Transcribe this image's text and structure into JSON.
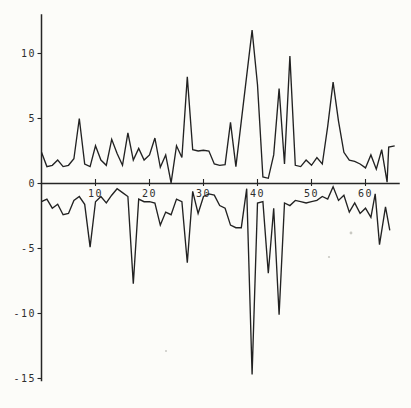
{
  "title": "",
  "colors": {
    "background": "#fcfcf9",
    "line": "#222222",
    "axis": "#262626",
    "label": "#2e2e2e",
    "speck": "#c9c9c3"
  },
  "chart_data": {
    "type": "line",
    "title": "",
    "xlabel": "",
    "ylabel": "",
    "xlim": [
      0,
      66
    ],
    "ylim": [
      -15.5,
      13
    ],
    "grid": false,
    "legend": false,
    "x_ticks": [
      10,
      20,
      30,
      40,
      50,
      60
    ],
    "x_tick_labels": [
      "10",
      "20",
      "30",
      "40",
      "50",
      "60"
    ],
    "y_ticks": [
      10,
      5,
      0,
      -5,
      -10,
      -15
    ],
    "y_tick_labels": [
      "10",
      "5",
      "0",
      "-5",
      "-10",
      "-15"
    ],
    "series": [
      {
        "name": "upper-line",
        "points": [
          [
            0,
            2.4
          ],
          [
            1,
            1.3
          ],
          [
            2,
            1.4
          ],
          [
            3,
            1.8
          ],
          [
            4,
            1.3
          ],
          [
            5,
            1.4
          ],
          [
            6,
            1.9
          ],
          [
            7,
            5.0
          ],
          [
            8,
            1.5
          ],
          [
            9,
            1.3
          ],
          [
            10,
            2.9
          ],
          [
            11,
            1.8
          ],
          [
            12,
            1.4
          ],
          [
            13,
            3.4
          ],
          [
            14,
            2.3
          ],
          [
            15,
            1.4
          ],
          [
            16,
            3.9
          ],
          [
            17,
            1.8
          ],
          [
            18,
            2.7
          ],
          [
            19,
            1.8
          ],
          [
            20,
            2.2
          ],
          [
            21,
            3.5
          ],
          [
            22,
            1.25
          ],
          [
            23,
            2.2
          ],
          [
            24,
            0.05
          ],
          [
            25,
            2.9
          ],
          [
            26,
            2.0
          ],
          [
            27,
            8.2
          ],
          [
            28,
            2.6
          ],
          [
            29,
            2.5
          ],
          [
            30,
            2.55
          ],
          [
            31,
            2.5
          ],
          [
            32,
            1.5
          ],
          [
            33,
            1.4
          ],
          [
            34,
            1.45
          ],
          [
            35,
            4.7
          ],
          [
            36,
            1.3
          ],
          [
            37,
            4.8
          ],
          [
            38,
            8.3
          ],
          [
            39,
            11.8
          ],
          [
            40,
            7.6
          ],
          [
            41,
            0.5
          ],
          [
            42,
            0.4
          ],
          [
            43,
            2.2
          ],
          [
            44,
            7.3
          ],
          [
            45,
            1.5
          ],
          [
            46,
            9.8
          ],
          [
            47,
            1.4
          ],
          [
            48,
            1.3
          ],
          [
            49,
            1.8
          ],
          [
            50,
            1.4
          ],
          [
            51,
            2.0
          ],
          [
            52,
            1.5
          ],
          [
            53,
            4.4
          ],
          [
            54,
            7.8
          ],
          [
            55,
            4.8
          ],
          [
            56,
            2.4
          ],
          [
            57,
            1.8
          ],
          [
            58,
            1.7
          ],
          [
            59,
            1.5
          ],
          [
            60,
            1.2
          ],
          [
            61,
            2.2
          ],
          [
            62,
            1.1
          ],
          [
            63,
            2.6
          ],
          [
            64,
            0.1
          ],
          [
            64.3,
            2.8
          ],
          [
            65.4,
            2.9
          ]
        ]
      },
      {
        "name": "lower-line",
        "points": [
          [
            0,
            -1.4
          ],
          [
            1,
            -1.2
          ],
          [
            2,
            -1.9
          ],
          [
            3,
            -1.6
          ],
          [
            4,
            -2.4
          ],
          [
            5,
            -2.3
          ],
          [
            6,
            -1.3
          ],
          [
            7,
            -1.0
          ],
          [
            8,
            -1.6
          ],
          [
            9,
            -4.9
          ],
          [
            10,
            -1.4
          ],
          [
            11,
            -1.0
          ],
          [
            12,
            -1.5
          ],
          [
            13,
            -0.9
          ],
          [
            14,
            -0.4
          ],
          [
            15,
            -0.7
          ],
          [
            16,
            -1.0
          ],
          [
            17,
            -7.7
          ],
          [
            18,
            -1.2
          ],
          [
            19,
            -1.4
          ],
          [
            20,
            -1.4
          ],
          [
            21,
            -1.5
          ],
          [
            22,
            -3.2
          ],
          [
            23,
            -2.2
          ],
          [
            24,
            -2.4
          ],
          [
            25,
            -1.2
          ],
          [
            26,
            -1.4
          ],
          [
            27,
            -6.1
          ],
          [
            28,
            -0.6
          ],
          [
            29,
            -2.3
          ],
          [
            30,
            -1.0
          ],
          [
            31,
            -0.8
          ],
          [
            32,
            -0.9
          ],
          [
            33,
            -1.7
          ],
          [
            34,
            -1.9
          ],
          [
            35,
            -3.2
          ],
          [
            36,
            -3.4
          ],
          [
            37,
            -3.4
          ],
          [
            38,
            -0.4
          ],
          [
            39,
            -14.7
          ],
          [
            40,
            -1.5
          ],
          [
            41,
            -1.4
          ],
          [
            42,
            -6.9
          ],
          [
            43,
            -1.9
          ],
          [
            44,
            -10.1
          ],
          [
            45,
            -1.5
          ],
          [
            46,
            -1.7
          ],
          [
            47,
            -1.3
          ],
          [
            48,
            -1.4
          ],
          [
            49,
            -1.5
          ],
          [
            50,
            -1.4
          ],
          [
            51,
            -1.3
          ],
          [
            52,
            -1.0
          ],
          [
            53,
            -1.2
          ],
          [
            54,
            -0.25
          ],
          [
            55,
            -1.3
          ],
          [
            56,
            -0.9
          ],
          [
            57,
            -2.2
          ],
          [
            58,
            -1.5
          ],
          [
            59,
            -2.3
          ],
          [
            60,
            -1.9
          ],
          [
            61,
            -2.6
          ],
          [
            61.8,
            -0.8
          ],
          [
            62.6,
            -4.7
          ],
          [
            63.7,
            -1.8
          ],
          [
            64.5,
            -3.6
          ]
        ]
      }
    ]
  }
}
